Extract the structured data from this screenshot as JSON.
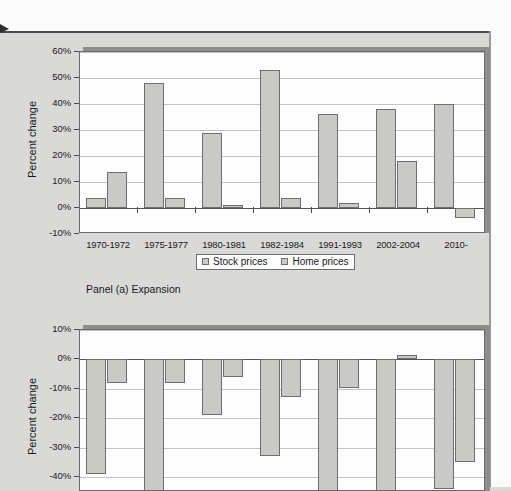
{
  "page": {
    "background_color": "#d9d9d7",
    "paper_color": "#fcfcfc"
  },
  "legend": {
    "stock_label": "Stock prices",
    "home_label": "Home prices",
    "stock_swatch_color": "#c9c9c7",
    "home_swatch_color": "#c9c9c7"
  },
  "panel_a": {
    "caption": "Panel (a) Expansion",
    "axis_title": "Percent change",
    "ytick_labels": [
      "60%",
      "50%",
      "40%",
      "30%",
      "20%",
      "10%",
      "0%",
      "-10%"
    ]
  },
  "panel_b": {
    "caption": "",
    "axis_title": "Percent change",
    "ytick_labels": [
      "10%",
      "0%",
      "-10%",
      "-20%",
      "-30%",
      "-40%"
    ]
  },
  "chart_data": [
    {
      "type": "bar",
      "title": "Panel (a) Expansion",
      "xlabel": "",
      "ylabel": "Percent change",
      "ylim": [
        -10,
        60
      ],
      "ytick_values": [
        60,
        50,
        40,
        30,
        20,
        10,
        0,
        -10
      ],
      "grid": true,
      "legend_position": "bottom",
      "categories": [
        "1970-1972",
        "1975-1977",
        "1980-1981",
        "1982-1984",
        "1991-1993",
        "2002-2004",
        "2010-"
      ],
      "series": [
        {
          "name": "Stock prices",
          "values": [
            4,
            48,
            29,
            53,
            36,
            38,
            40
          ]
        },
        {
          "name": "Home prices",
          "values": [
            14,
            4,
            1,
            4,
            2,
            18,
            -4
          ]
        }
      ]
    },
    {
      "type": "bar",
      "title": "Panel (b)",
      "xlabel": "",
      "ylabel": "Percent change",
      "ylim": [
        -45,
        10
      ],
      "ytick_values": [
        10,
        0,
        -10,
        -20,
        -30,
        -40
      ],
      "grid": true,
      "legend_position": "none",
      "note": "lower panel is cropped by the bottom of the screenshot",
      "categories": [
        "1",
        "2",
        "3",
        "4",
        "5",
        "6",
        "7"
      ],
      "series": [
        {
          "name": "Stock prices",
          "values": [
            -39,
            -45,
            -19,
            -33,
            -45,
            -45,
            -44
          ]
        },
        {
          "name": "Home prices",
          "values": [
            -8,
            -8,
            -6,
            -13,
            -10,
            1.5,
            -35
          ]
        }
      ]
    }
  ]
}
